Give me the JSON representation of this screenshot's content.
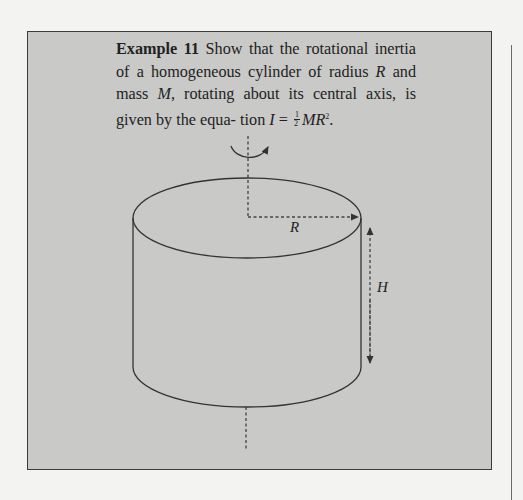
{
  "example": {
    "label": "Example 11",
    "text_line1": "Show that the rotational inertia of a",
    "text_line2_a": "homogeneous cylinder of radius ",
    "text_line2_var_r": "R",
    "text_line2_b": " and mass ",
    "text_line2_var_m": "M",
    "text_line2_c": ",",
    "text_line3": "rotating about its central axis, is given by the equa-",
    "text_line4_a": "tion ",
    "equation_lhs": "I",
    "equation_eq": " = ",
    "frac_num": "1",
    "frac_den": "2",
    "equation_rhs": "MR",
    "equation_exp": "2",
    "equation_end": "."
  },
  "figure": {
    "radius_label": "R",
    "height_label": "H",
    "colors": {
      "box_bg": "#c9c9c7",
      "page_bg": "#f3f3f1",
      "line": "#333333"
    }
  }
}
